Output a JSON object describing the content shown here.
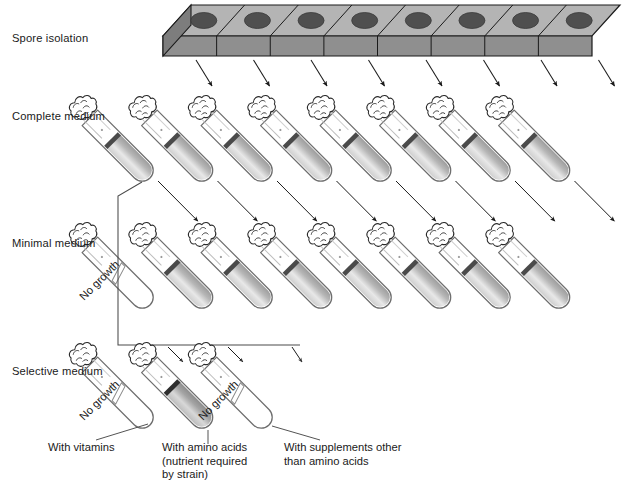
{
  "figure": {
    "stage_labels": [
      {
        "key": "spore_isolation",
        "text": "Spore isolation",
        "x": 12,
        "y": 32
      },
      {
        "key": "complete_medium",
        "text": "Complete medium",
        "x": 12,
        "y": 110
      },
      {
        "key": "minimal_medium",
        "text": "Minimal medium",
        "x": 12,
        "y": 237
      },
      {
        "key": "selective_medium",
        "text": "Selective medium",
        "x": 12,
        "y": 365
      }
    ],
    "caption_labels": [
      {
        "key": "with_vitamins",
        "lines": [
          "With vitamins"
        ],
        "x": 48,
        "y": 441
      },
      {
        "key": "with_amino_acids",
        "lines": [
          "With amino acids",
          "(nutrient required",
          "by strain)"
        ],
        "x": 162,
        "y": 441
      },
      {
        "key": "with_supplements",
        "lines": [
          "With supplements other",
          "than amino acids"
        ],
        "x": 284,
        "y": 441
      }
    ],
    "no_growth_text": "No growth"
  },
  "tray": {
    "name": "spore-isolation-tray",
    "compartments": 8,
    "spore_spots": 8,
    "top_color": "#b4b4b4",
    "front_color": "#8f8f8f",
    "spot_color": "#4f4f4f",
    "outline_color": "#1a1a1a"
  },
  "rows": {
    "complete_medium": {
      "name": "complete-medium-row",
      "tube_count": 8,
      "tubes": [
        {
          "id": "cm-1",
          "growth": true,
          "label": ""
        },
        {
          "id": "cm-2",
          "growth": true,
          "label": ""
        },
        {
          "id": "cm-3",
          "growth": true,
          "label": ""
        },
        {
          "id": "cm-4",
          "growth": true,
          "label": ""
        },
        {
          "id": "cm-5",
          "growth": true,
          "label": ""
        },
        {
          "id": "cm-6",
          "growth": true,
          "label": ""
        },
        {
          "id": "cm-7",
          "growth": true,
          "label": ""
        },
        {
          "id": "cm-8",
          "growth": true,
          "label": ""
        }
      ]
    },
    "minimal_medium": {
      "name": "minimal-medium-row",
      "tube_count": 8,
      "tubes": [
        {
          "id": "mm-1",
          "growth": false,
          "label": "No growth"
        },
        {
          "id": "mm-2",
          "growth": true,
          "label": ""
        },
        {
          "id": "mm-3",
          "growth": true,
          "label": ""
        },
        {
          "id": "mm-4",
          "growth": true,
          "label": ""
        },
        {
          "id": "mm-5",
          "growth": true,
          "label": ""
        },
        {
          "id": "mm-6",
          "growth": true,
          "label": ""
        },
        {
          "id": "mm-7",
          "growth": true,
          "label": ""
        },
        {
          "id": "mm-8",
          "growth": true,
          "label": ""
        }
      ]
    },
    "selective_medium": {
      "name": "selective-medium-row",
      "tube_count": 3,
      "tubes": [
        {
          "id": "sm-1",
          "growth": false,
          "label": "No growth"
        },
        {
          "id": "sm-2",
          "growth": true,
          "label": ""
        },
        {
          "id": "sm-3",
          "growth": false,
          "label": "No growth"
        }
      ]
    }
  },
  "colors": {
    "medium_light": "#e2e2e2",
    "medium_dark": "#9a9a9a",
    "medium_surface": "#4a4a4a",
    "medium_surface_strong": "#2e2e2e",
    "glass_outline": "#6e6e6e",
    "arrow": "#1a1a1a",
    "bracket": "#4a4a4a"
  }
}
